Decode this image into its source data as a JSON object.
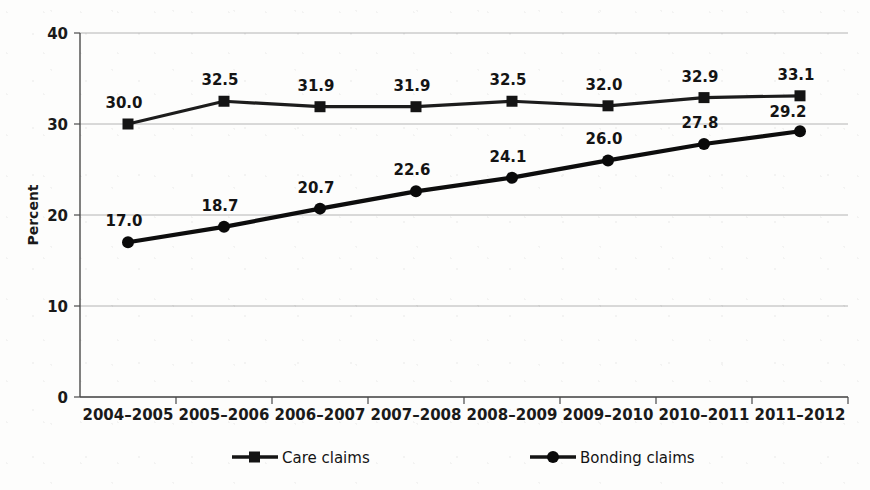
{
  "chart_data": {
    "type": "line",
    "title": "",
    "xlabel": "",
    "ylabel": "Percent",
    "ylim": [
      0,
      40
    ],
    "yticks": [
      0,
      10,
      20,
      30,
      40
    ],
    "ytick_labels": [
      "0",
      "10",
      "20",
      "30",
      "40"
    ],
    "grid": true,
    "legend_position": "bottom",
    "categories": [
      "2004–2005",
      "2005–2006",
      "2006–2007",
      "2007–2008",
      "2008–2009",
      "2009–2010",
      "2010–2011",
      "2011–2012"
    ],
    "series": [
      {
        "name": "Care claims",
        "marker": "square",
        "color": "#141414",
        "values": [
          30.0,
          32.5,
          31.9,
          31.9,
          32.5,
          32.0,
          32.9,
          33.1
        ],
        "labels": [
          "30.0",
          "32.5",
          "31.9",
          "31.9",
          "32.5",
          "32.0",
          "32.9",
          "33.1"
        ]
      },
      {
        "name": "Bonding claims",
        "marker": "circle",
        "color": "#0a0a0a",
        "values": [
          17.0,
          18.7,
          20.7,
          22.6,
          24.1,
          26.0,
          27.8,
          29.2
        ],
        "labels": [
          "17.0",
          "18.7",
          "20.7",
          "22.6",
          "24.1",
          "26.0",
          "27.8",
          "29.2"
        ]
      }
    ]
  },
  "legend": {
    "items": [
      {
        "label": "Care claims",
        "marker": "square-marker-icon"
      },
      {
        "label": "Bonding claims",
        "marker": "circle-marker-icon"
      }
    ]
  },
  "colors": {
    "background": "#fdfdfc",
    "gridline": "#b4b4b4",
    "axis": "#4a4a4a",
    "text": "#141414"
  }
}
